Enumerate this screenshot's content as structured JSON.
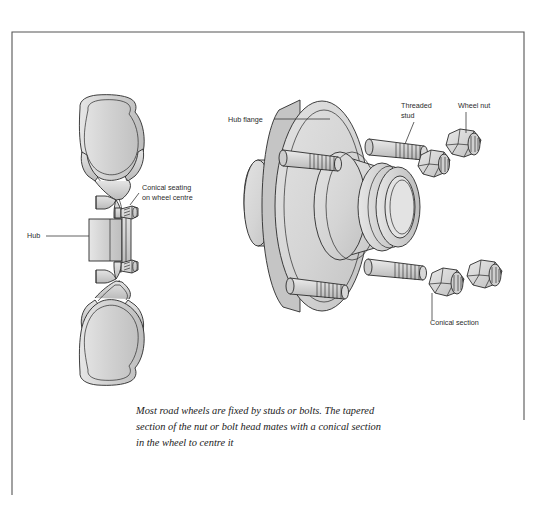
{
  "figure": {
    "caption": {
      "line1": "Most road wheels are fixed by studs or bolts. The tapered",
      "line2": "section of the nut or bolt head mates with a conical section",
      "line3": "in the wheel to centre it"
    },
    "border": {
      "color": "#555555",
      "left": 12,
      "top": 32,
      "right": 524,
      "bottom": 495
    },
    "colors": {
      "paper": "#ffffff",
      "metal_light": "#dcdcdc",
      "metal_mid": "#c9c9c9",
      "metal_dark": "#b4b4b4",
      "outline": "#2a2a2a",
      "text": "#2b2b2b"
    },
    "labels": [
      {
        "id": "hub",
        "text": "Hub",
        "x": 27,
        "y": 238
      },
      {
        "id": "conical-seating-1",
        "text": "Conical seating",
        "x": 142,
        "y": 190
      },
      {
        "id": "conical-seating-2",
        "text": "on wheel centre",
        "x": 142,
        "y": 200
      },
      {
        "id": "hub-flange",
        "text": "Hub flange",
        "x": 228,
        "y": 122
      },
      {
        "id": "threaded-stud-1",
        "text": "Threaded",
        "x": 401,
        "y": 108
      },
      {
        "id": "threaded-stud-2",
        "text": "stud",
        "x": 401,
        "y": 118
      },
      {
        "id": "wheel-nut",
        "text": "Wheel nut",
        "x": 458,
        "y": 108
      },
      {
        "id": "conical-section",
        "text": "Conical section",
        "x": 430,
        "y": 325
      }
    ],
    "left_diagram": {
      "name": "wheel-rim-cross-section",
      "parts": [
        "upper-tyre-bead-ring",
        "rim-well-profile",
        "hub-block",
        "wheel-bolt-upper",
        "wheel-bolt-lower",
        "lower-tyre-bead-ring"
      ]
    },
    "right_diagram": {
      "name": "hub-flange-assembly",
      "parts": [
        "hub-flange-disc",
        "hub-boss",
        "centre-bore",
        "threaded-stud-upper-right",
        "threaded-stud-upper-left",
        "threaded-stud-lower-right",
        "threaded-stud-lower-left",
        "wheel-nut-top",
        "wheel-nut-mid",
        "wheel-nut-lower-left",
        "wheel-nut-lower-right"
      ]
    }
  }
}
